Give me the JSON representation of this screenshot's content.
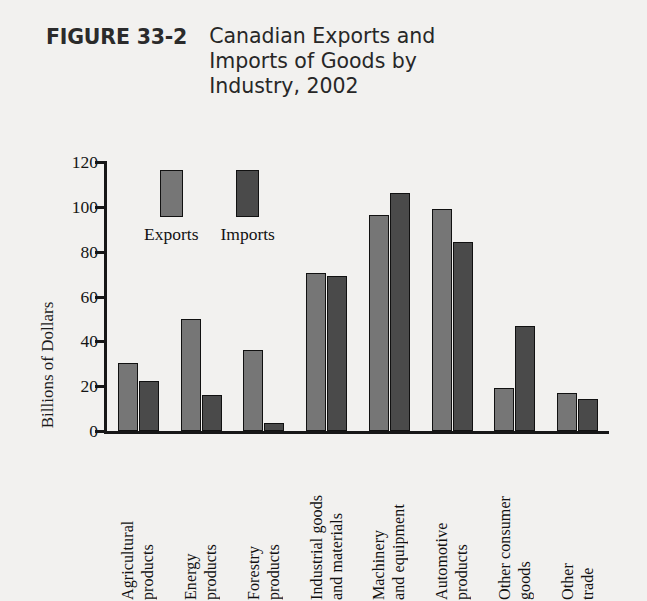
{
  "figure": {
    "number": "FIGURE 33-2",
    "title": "Canadian Exports and Imports of Goods by Industry, 2002"
  },
  "chart_data": {
    "type": "bar",
    "title": "Canadian Exports and Imports of Goods by Industry, 2002",
    "xlabel": "",
    "ylabel": "Billions of Dollars",
    "ylim": [
      0,
      120
    ],
    "yticks": [
      0,
      20,
      40,
      60,
      80,
      100,
      120
    ],
    "ytick_labels": [
      "0",
      "20",
      "40",
      "60",
      "80",
      "100",
      "120"
    ],
    "grid": false,
    "legend_position": "upper-left-inside",
    "categories": [
      "Agricultural products",
      "Energy products",
      "Forestry products",
      "Industrial goods and materials",
      "Machinery and equipment",
      "Automotive products",
      "Other consumer goods",
      "Other trade"
    ],
    "category_label_lines": [
      "Agricultural\nproducts",
      "Energy\nproducts",
      "Forestry\nproducts",
      "Industrial goods\nand materials",
      "Machinery\nand equipment",
      "Automotive\nproducts",
      "Other consumer\ngoods",
      "Other\ntrade"
    ],
    "series": [
      {
        "name": "Exports",
        "color": "#767676",
        "values": [
          30.5,
          50,
          36,
          70.5,
          96.5,
          99,
          19,
          17
        ]
      },
      {
        "name": "Imports",
        "color": "#4a4a4a",
        "values": [
          22.5,
          16,
          3.5,
          69,
          106,
          84.5,
          47,
          14.5
        ]
      }
    ]
  },
  "legend": {
    "entries": [
      {
        "label": "Exports",
        "variant": "exports"
      },
      {
        "label": "Imports",
        "variant": "imports"
      }
    ]
  },
  "colors": {
    "exports": "#767676",
    "imports": "#4a4a4a",
    "axis": "#171717",
    "background": "#f2f1ef",
    "plot_background": "#ffffff"
  }
}
